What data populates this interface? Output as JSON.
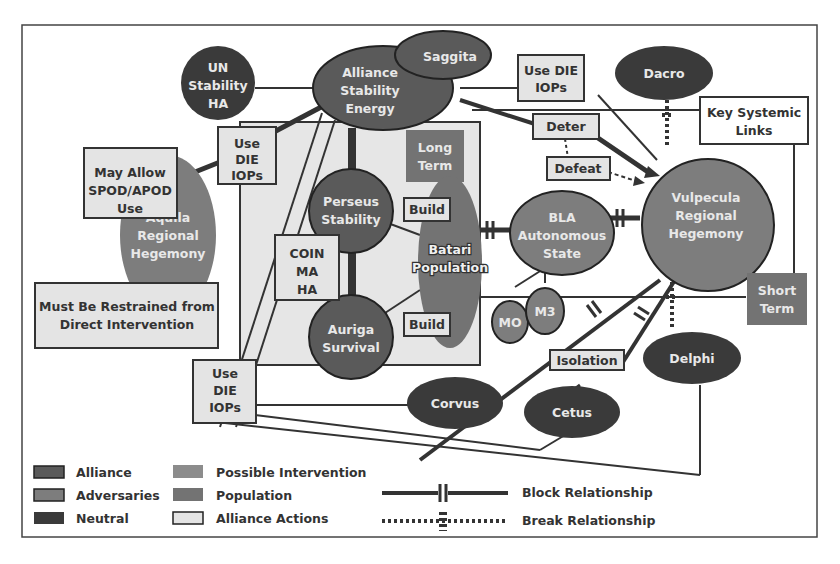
{
  "colors": {
    "alliance": "#5a5a5a",
    "adversaries": "#7d7d7d",
    "neutral": "#3a3a3a",
    "possible_intervention": "#8c8c8c",
    "population": "#737373",
    "alliance_actions": "#e4e4e4",
    "region_box": "#e6e6e6",
    "line": "#333333"
  },
  "nodes": {
    "un": [
      "UN",
      "Stability",
      "HA"
    ],
    "alliance": [
      "Alliance",
      "Stability",
      "Energy"
    ],
    "saggita": [
      "Saggita"
    ],
    "dacro": [
      "Dacro"
    ],
    "aquila": [
      "Aquila",
      "Regional",
      "Hegemony"
    ],
    "perseus": [
      "Perseus",
      "Stability"
    ],
    "auriga": [
      "Auriga",
      "Survival"
    ],
    "batari": [
      "Batari",
      "Population"
    ],
    "bla": [
      "BLA",
      "Autonomous",
      "State"
    ],
    "vulpecula": [
      "Vulpecula",
      "Regional",
      "Hegemony"
    ],
    "mo": [
      "MO"
    ],
    "m3": [
      "M3"
    ],
    "delphi": [
      "Delphi"
    ],
    "corvus": [
      "Corvus"
    ],
    "cetus": [
      "Cetus"
    ]
  },
  "boxes": {
    "may_allow": [
      "May Allow",
      "SPOD/APOD",
      "Use"
    ],
    "use_die_1": [
      "Use",
      "DIE",
      "IOPs"
    ],
    "use_die_2": [
      "Use DIE",
      "IOPs"
    ],
    "use_die_3": [
      "Use",
      "DIE",
      "IOPs"
    ],
    "deter": [
      "Deter"
    ],
    "defeat": [
      "Defeat"
    ],
    "coin": [
      "COIN",
      "MA",
      "HA"
    ],
    "build_1": [
      "Build"
    ],
    "build_2": [
      "Build"
    ],
    "must_be": [
      "Must Be Restrained from",
      "Direct Intervention"
    ],
    "isolation": [
      "Isolation"
    ],
    "key_links": [
      "Key Systemic",
      "Links"
    ],
    "long_term": [
      "Long",
      "Term"
    ],
    "short_term": [
      "Short",
      "Term"
    ]
  },
  "legend": {
    "items": [
      {
        "label": "Alliance"
      },
      {
        "label": "Adversaries"
      },
      {
        "label": "Neutral"
      },
      {
        "label": "Possible Intervention"
      },
      {
        "label": "Population"
      },
      {
        "label": "Alliance Actions"
      }
    ],
    "block": "Block Relationship",
    "break": "Break Relationship"
  }
}
